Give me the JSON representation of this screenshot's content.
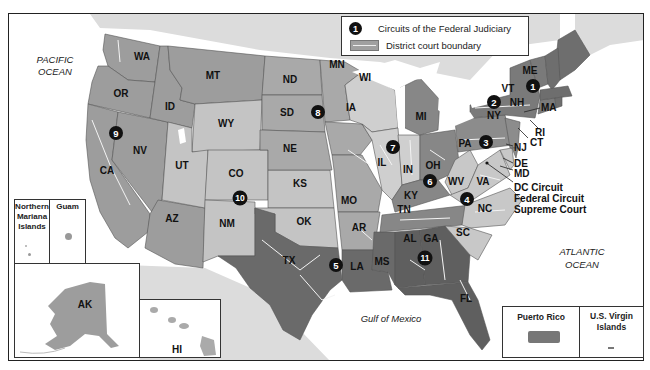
{
  "legend": {
    "circuit_badge": "1",
    "circuits_label": "Circuits of the Federal Judiciary",
    "district_label": "District court boundary"
  },
  "oceans": {
    "pacific": [
      "PACIFIC",
      "OCEAN"
    ],
    "atlantic": [
      "ATLANTIC",
      "OCEAN"
    ],
    "gulf": "Gulf of Mexico"
  },
  "states": {
    "WA": "WA",
    "OR": "OR",
    "CA": "CA",
    "NV": "NV",
    "ID": "ID",
    "MT": "MT",
    "WY": "WY",
    "UT": "UT",
    "CO": "CO",
    "AZ": "AZ",
    "NM": "NM",
    "ND": "ND",
    "SD": "SD",
    "NE": "NE",
    "KS": "KS",
    "OK": "OK",
    "TX": "TX",
    "MN": "MN",
    "IA": "IA",
    "MO": "MO",
    "AR": "AR",
    "LA": "LA",
    "WI": "WI",
    "IL": "IL",
    "IN": "IN",
    "MI": "MI",
    "OH": "OH",
    "KY": "KY",
    "TN": "TN",
    "MS": "MS",
    "AL": "AL",
    "GA": "GA",
    "FL": "FL",
    "SC": "SC",
    "NC": "NC",
    "VA": "VA",
    "WV": "WV",
    "PA": "PA",
    "NY": "NY",
    "VT": "VT",
    "NH": "NH",
    "ME": "ME",
    "MA": "MA",
    "RI": "RI",
    "CT": "CT",
    "NJ": "NJ",
    "DE": "DE",
    "MD": "MD",
    "AK": "AK",
    "HI": "HI"
  },
  "callouts": {
    "dc_circuit": "DC Circuit",
    "federal_circuit": "Federal Circuit",
    "supreme_court": "Supreme Court"
  },
  "circuits": [
    "1",
    "2",
    "3",
    "4",
    "5",
    "6",
    "7",
    "8",
    "9",
    "10",
    "11"
  ],
  "insets": {
    "northern_mariana": [
      "Northern",
      "Mariana",
      "Islands"
    ],
    "guam": "Guam",
    "puerto_rico": "Puerto Rico",
    "usvi": [
      "U.S. Virgin",
      "Islands"
    ]
  },
  "colors": {
    "c1": "#6e6e6e",
    "c2": "#7a7a7a",
    "c3": "#8c8c8c",
    "c4": "#c8c8c8",
    "c5": "#6a6a6a",
    "c6": "#878787",
    "c7": "#cfcfcf",
    "c8": "#a9a9a9",
    "c9": "#9d9d9d",
    "c10": "#c4c4c4",
    "c11": "#5f5f5f",
    "land_foreign": "#d9d9d9",
    "water": "#ffffff"
  }
}
